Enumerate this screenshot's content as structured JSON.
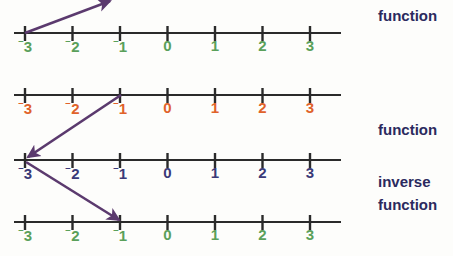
{
  "diagram": {
    "background_color": "#fdfdfb",
    "axis_color": "#2a2a2a",
    "arrow_color": "#5b3a6e",
    "number_lines": [
      {
        "id": "line-1",
        "role": "domain-top",
        "label_color": "#5aa05a",
        "axis_y": 33,
        "label_y": 38,
        "x_start": 14,
        "x_end": 341,
        "tick_spacing": 47.5,
        "first_tick_x": 25,
        "ticks": [
          {
            "value": -3,
            "display": "3",
            "negative": true,
            "x": 25
          },
          {
            "value": -2,
            "display": "2",
            "negative": true,
            "x": 72.5
          },
          {
            "value": -1,
            "display": "1",
            "negative": true,
            "x": 120
          },
          {
            "value": 0,
            "display": "0",
            "negative": false,
            "x": 167.5
          },
          {
            "value": 1,
            "display": "1",
            "negative": false,
            "x": 215
          },
          {
            "value": 2,
            "display": "2",
            "negative": false,
            "x": 262.5
          },
          {
            "value": 3,
            "display": "3",
            "negative": false,
            "x": 310
          }
        ]
      },
      {
        "id": "line-2",
        "role": "range-function",
        "label_color": "#e0622a",
        "axis_y": 95,
        "label_y": 100,
        "x_start": 14,
        "x_end": 341,
        "tick_spacing": 47.5,
        "first_tick_x": 25,
        "ticks": [
          {
            "value": -3,
            "display": "3",
            "negative": true,
            "x": 25
          },
          {
            "value": -2,
            "display": "2",
            "negative": true,
            "x": 72.5
          },
          {
            "value": -1,
            "display": "1",
            "negative": true,
            "x": 120
          },
          {
            "value": 0,
            "display": "0",
            "negative": false,
            "x": 167.5
          },
          {
            "value": 1,
            "display": "1",
            "negative": false,
            "x": 215
          },
          {
            "value": 2,
            "display": "2",
            "negative": false,
            "x": 262.5
          },
          {
            "value": 3,
            "display": "3",
            "negative": false,
            "x": 310
          }
        ]
      },
      {
        "id": "line-3",
        "role": "domain-inverse",
        "label_color": "#3a3a78",
        "axis_y": 160,
        "label_y": 165,
        "x_start": 14,
        "x_end": 341,
        "tick_spacing": 47.5,
        "first_tick_x": 25,
        "ticks": [
          {
            "value": -3,
            "display": "3",
            "negative": true,
            "x": 25
          },
          {
            "value": -2,
            "display": "2",
            "negative": true,
            "x": 72.5
          },
          {
            "value": -1,
            "display": "1",
            "negative": true,
            "x": 120
          },
          {
            "value": 0,
            "display": "0",
            "negative": false,
            "x": 167.5
          },
          {
            "value": 1,
            "display": "1",
            "negative": false,
            "x": 215
          },
          {
            "value": 2,
            "display": "2",
            "negative": false,
            "x": 262.5
          },
          {
            "value": 3,
            "display": "3",
            "negative": false,
            "x": 310
          }
        ]
      },
      {
        "id": "line-4",
        "role": "range-inverse",
        "label_color": "#5aa05a",
        "axis_y": 222,
        "label_y": 227,
        "x_start": 14,
        "x_end": 341,
        "tick_spacing": 47.5,
        "first_tick_x": 25,
        "ticks": [
          {
            "value": -3,
            "display": "3",
            "negative": true,
            "x": 25
          },
          {
            "value": -2,
            "display": "2",
            "negative": true,
            "x": 72.5
          },
          {
            "value": -1,
            "display": "1",
            "negative": true,
            "x": 120
          },
          {
            "value": 0,
            "display": "0",
            "negative": false,
            "x": 167.5
          },
          {
            "value": 1,
            "display": "1",
            "negative": false,
            "x": 215
          },
          {
            "value": 2,
            "display": "2",
            "negative": false,
            "x": 262.5
          },
          {
            "value": 3,
            "display": "3",
            "negative": false,
            "x": 310
          }
        ]
      }
    ],
    "mapping_arrows": [
      {
        "id": "arrow-1",
        "from_label": "-3",
        "to_label": "off-chart upper right",
        "from": {
          "x": 25,
          "y": 33
        },
        "to": {
          "x": 110,
          "y": 0
        },
        "direction": "up-right"
      },
      {
        "id": "arrow-2",
        "from_label": "-1",
        "to_label": "-3",
        "from": {
          "x": 121,
          "y": 95
        },
        "to": {
          "x": 26,
          "y": 158
        },
        "direction": "down-left"
      },
      {
        "id": "arrow-3",
        "from_label": "-3",
        "to_label": "-1",
        "from": {
          "x": 26,
          "y": 162
        },
        "to": {
          "x": 121,
          "y": 221
        },
        "direction": "down-right"
      }
    ],
    "side_labels": [
      {
        "id": "side-label-1",
        "text": "function",
        "x": 378,
        "y": 8
      },
      {
        "id": "side-label-2",
        "text": "function",
        "x": 378,
        "y": 122
      },
      {
        "id": "side-label-3",
        "text": "inverse",
        "x": 378,
        "y": 174
      },
      {
        "id": "side-label-4",
        "text": "function",
        "x": 378,
        "y": 197
      }
    ]
  }
}
